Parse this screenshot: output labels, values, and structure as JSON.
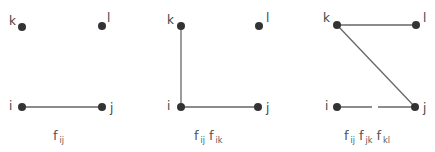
{
  "diagrams": [
    {
      "caption": [
        {
          "f": "f",
          "sub": "ij"
        }
      ],
      "nodes": {
        "k": "k",
        "l": "l",
        "i": "i",
        "j": "j"
      }
    },
    {
      "caption": [
        {
          "f": "f",
          "sub": "ij"
        },
        {
          "f": "f",
          "sub": "ik"
        }
      ],
      "nodes": {
        "k": "k",
        "l": "l",
        "i": "i",
        "j": "j"
      }
    },
    {
      "caption": [
        {
          "f": "f",
          "sub": "ij"
        },
        {
          "f": "f",
          "sub": "jk"
        },
        {
          "f": "f",
          "sub": "kl"
        }
      ],
      "nodes": {
        "k": "k",
        "l": "l",
        "i": "i",
        "j": "j"
      }
    }
  ],
  "colors": {
    "node": "#333333",
    "edge": "#666666"
  }
}
